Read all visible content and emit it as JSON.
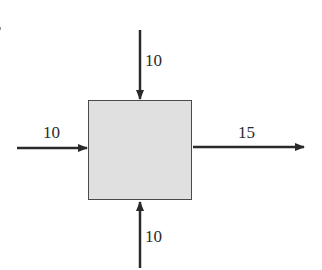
{
  "diagram": {
    "type": "flow-balance-block",
    "block": {
      "label": "",
      "fill_color": "#e0e0e0",
      "border_color": "#4a4a4a"
    },
    "streams": [
      {
        "id": "top-inflow",
        "direction": "in",
        "side": "top",
        "value": "10"
      },
      {
        "id": "left-inflow",
        "direction": "in",
        "side": "left",
        "value": "10"
      },
      {
        "id": "bottom-inflow",
        "direction": "in",
        "side": "bottom",
        "value": "10"
      },
      {
        "id": "right-outflow",
        "direction": "out",
        "side": "right",
        "value": "15"
      }
    ],
    "arrow_color": "#2a2a2a"
  }
}
